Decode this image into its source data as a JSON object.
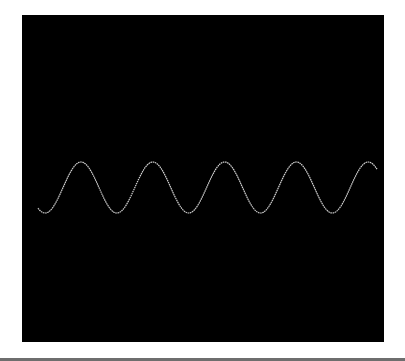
{
  "chart_data": {
    "type": "line",
    "title": "",
    "xlabel": "",
    "ylabel": "",
    "grid": false,
    "legend": null,
    "background_color": "#000000",
    "line_color": "#d0d0d0",
    "series": [
      {
        "name": "sine-wave",
        "description": "Sinusoidal waveform, ~4.8 cycles across the plot",
        "x_pixel_range": [
          38,
          377
        ],
        "center_y_pixel": 187.5,
        "amplitude_pixels": 25.5,
        "period_pixels": 71.8,
        "peak_x_pixels": [
          81,
          153,
          225,
          296,
          368
        ],
        "trough_x_pixels": [
          49,
          117,
          189,
          261,
          332
        ]
      }
    ]
  },
  "frame": {
    "bottom_rule_color": "#6e6e6e"
  }
}
